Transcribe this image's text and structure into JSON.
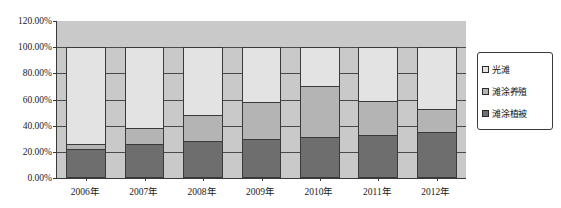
{
  "chart_data": {
    "type": "bar",
    "subtype": "100% stacked column",
    "title": "",
    "xlabel": "",
    "ylabel": "",
    "ylim": [
      0,
      120
    ],
    "ytick_labels": [
      "0.00%",
      "20.00%",
      "40.00%",
      "60.00%",
      "80.00%",
      "100.00%",
      "120.00%"
    ],
    "ytick_values": [
      0,
      20,
      40,
      60,
      80,
      100,
      120
    ],
    "grid": true,
    "legend_position": "right",
    "categories": [
      "2006年",
      "2007年",
      "2008年",
      "2009年",
      "2010年",
      "2011年",
      "2012年"
    ],
    "series": [
      {
        "name": "滩涂植被",
        "color": "#6e6e6e",
        "values": [
          22,
          26,
          28,
          30,
          31,
          33,
          35
        ]
      },
      {
        "name": "滩涂养殖",
        "color": "#b4b4b4",
        "values": [
          4,
          12,
          20,
          28,
          39,
          26,
          18
        ]
      },
      {
        "name": "光滩",
        "color": "#e3e3e3",
        "values": [
          74,
          62,
          52,
          42,
          30,
          41,
          47
        ]
      }
    ]
  },
  "axes": {
    "y_labels": [
      {
        "text": "120.00%",
        "value": 120
      },
      {
        "text": "100.00%",
        "value": 100
      },
      {
        "text": "80.00%",
        "value": 80
      },
      {
        "text": "60.00%",
        "value": 60
      },
      {
        "text": "40.00%",
        "value": 40
      },
      {
        "text": "20.00%",
        "value": 20
      },
      {
        "text": "0.00%",
        "value": 0
      }
    ],
    "x_labels": [
      "2006年",
      "2007年",
      "2008年",
      "2009年",
      "2010年",
      "2011年",
      "2012年"
    ]
  },
  "legend": {
    "items": [
      {
        "label": "光滩",
        "color": "#e3e3e3"
      },
      {
        "label": "滩涂养殖",
        "color": "#b4b4b4"
      },
      {
        "label": "滩涂植被",
        "color": "#6e6e6e"
      }
    ]
  },
  "style": {
    "plot_background": "#c9c9c9",
    "page_background": "#ffffff",
    "axis_color": "#3a3a3a",
    "gridline_color": "#4a4a4a"
  }
}
